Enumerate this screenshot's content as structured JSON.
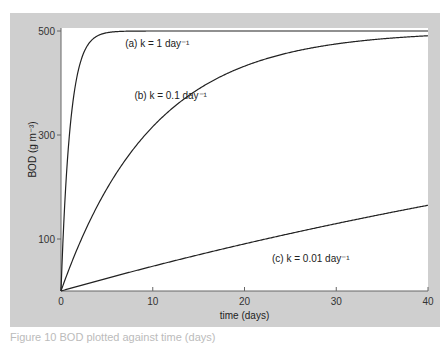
{
  "caption": "Figure 10 BOD plotted against time (days)",
  "chart_data": {
    "type": "line",
    "title": "",
    "xlabel": "time (days)",
    "ylabel": "BOD (g m⁻³)",
    "xlim": [
      0,
      40
    ],
    "ylim": [
      0,
      510
    ],
    "xticks": [
      0,
      10,
      20,
      30,
      40
    ],
    "yticks": [
      100,
      300,
      500
    ],
    "grid": false,
    "series": [
      {
        "name": "(a) k = 1 day⁻¹",
        "k": 1,
        "L0": 500
      },
      {
        "name": "(b) k = 0.1 day⁻¹",
        "k": 0.1,
        "L0": 500
      },
      {
        "name": "(c) k = 0.01 day⁻¹",
        "k": 0.01,
        "L0": 500
      }
    ],
    "annotations": [
      {
        "text": "(a)  k = 1 day⁻¹",
        "x": 7,
        "y": 470
      },
      {
        "text": "(b)  k = 0.1 day⁻¹",
        "x": 8,
        "y": 370
      },
      {
        "text": "(c)  k = 0.01 day⁻¹",
        "x": 23,
        "y": 55
      }
    ]
  }
}
